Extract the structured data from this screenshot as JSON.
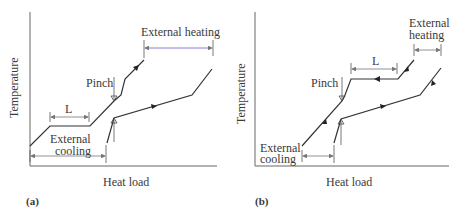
{
  "panels": [
    {
      "id": "a",
      "label": "(a)",
      "x_axis_label": "Heat load",
      "y_axis_label": "Temperature",
      "annotations": {
        "pinch": "Pinch",
        "L": "L",
        "external_heating": "External heating",
        "external_cooling_line1": "External",
        "external_cooling_line2": "cooling"
      }
    },
    {
      "id": "b",
      "label": "(b)",
      "x_axis_label": "Heat load",
      "y_axis_label": "Temperature",
      "annotations": {
        "pinch": "Pinch",
        "L": "L",
        "external_heating_line1": "External",
        "external_heating_line2": "heating",
        "external_cooling_line1": "External",
        "external_cooling_line2": "cooling"
      }
    }
  ],
  "colors": {
    "curve": "#333333",
    "axis": "#666666",
    "heating_dimension": "#6a5acd",
    "cooling_text_accent": "#2e7d32"
  }
}
